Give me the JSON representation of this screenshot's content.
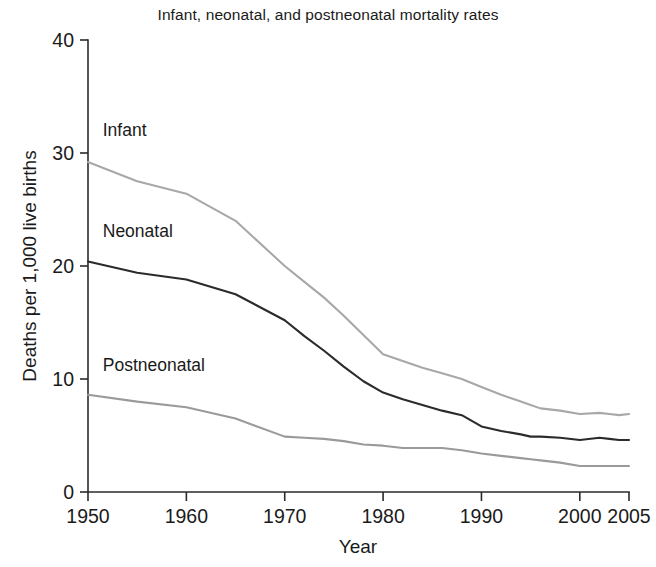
{
  "chart_data": {
    "type": "line",
    "title": "Infant, neonatal, and postneonatal mortality rates",
    "xlabel": "Year",
    "ylabel": "Deaths per 1,000 live births",
    "xlim": [
      1950,
      2005
    ],
    "ylim": [
      0,
      40
    ],
    "xticks": [
      1950,
      1960,
      1970,
      1980,
      1990,
      2000,
      2005
    ],
    "xtick_labels": [
      "1950",
      "1960",
      "1970",
      "1980",
      "1990",
      "2000",
      "2005"
    ],
    "yticks": [
      0,
      10,
      20,
      30,
      40
    ],
    "ytick_labels": [
      "0",
      "10",
      "20",
      "30",
      "40"
    ],
    "grid": false,
    "legend_position": "inline-labels",
    "x": [
      1950,
      1955,
      1960,
      1965,
      1970,
      1972,
      1974,
      1976,
      1978,
      1980,
      1982,
      1984,
      1986,
      1988,
      1990,
      1992,
      1994,
      1995,
      1996,
      1998,
      2000,
      2002,
      2003,
      2004,
      2005
    ],
    "series": [
      {
        "name": "Infant",
        "color": "#a8a8a8",
        "label": "Infant",
        "label_x": 1951.5,
        "label_y": 31.5,
        "values": [
          29.2,
          27.5,
          26.4,
          24.0,
          20.0,
          18.6,
          17.2,
          15.6,
          13.9,
          12.2,
          11.6,
          11.0,
          10.5,
          10.0,
          9.3,
          8.6,
          8.0,
          7.7,
          7.4,
          7.2,
          6.9,
          7.0,
          6.9,
          6.8,
          6.9
        ]
      },
      {
        "name": "Neonatal",
        "color": "#2b2b2b",
        "label": "Neonatal",
        "label_x": 1951.5,
        "label_y": 22.6,
        "values": [
          20.4,
          19.4,
          18.8,
          17.5,
          15.2,
          13.8,
          12.5,
          11.1,
          9.8,
          8.8,
          8.2,
          7.7,
          7.2,
          6.8,
          5.8,
          5.4,
          5.1,
          4.9,
          4.9,
          4.8,
          4.6,
          4.8,
          4.7,
          4.6,
          4.6
        ]
      },
      {
        "name": "Postneonatal",
        "color": "#9a9a9a",
        "label": "Postneonatal",
        "label_x": 1951.5,
        "label_y": 10.7,
        "values": [
          8.6,
          8.0,
          7.5,
          6.5,
          4.9,
          4.8,
          4.7,
          4.5,
          4.2,
          4.1,
          3.9,
          3.9,
          3.9,
          3.7,
          3.4,
          3.2,
          3.0,
          2.9,
          2.8,
          2.6,
          2.3,
          2.3,
          2.3,
          2.3,
          2.3
        ]
      }
    ]
  }
}
